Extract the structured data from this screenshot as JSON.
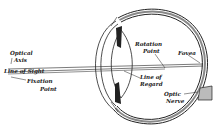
{
  "diagram": {
    "labels": {
      "optical_axis_1": "Optical",
      "optical_axis_2": "Axis",
      "line_of_sight": "Line of Sight",
      "fixation_1": "Fixation",
      "fixation_2": "Point",
      "rotation_1": "Rotation",
      "rotation_2": "Point",
      "fovea": "Fovea",
      "regard_1": "Line of",
      "regard_2": "Regard",
      "optic_1": "Optic",
      "optic_2": "Nerve"
    },
    "colors": {
      "line": "#222222",
      "background": "#ffffff"
    }
  }
}
